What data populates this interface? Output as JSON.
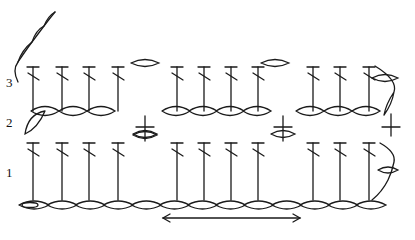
{
  "diagram": {
    "type": "crochet-stitch-chart",
    "row_labels": [
      {
        "text": "3",
        "x": 6,
        "y": 76
      },
      {
        "text": "2",
        "x": 6,
        "y": 116
      },
      {
        "text": "1",
        "x": 6,
        "y": 166
      }
    ],
    "colors": {
      "ink": "#1a1a1a",
      "background": "#ffffff"
    },
    "row3": {
      "top_y": 67,
      "bottom_y": 111,
      "dc_columns_x": [
        33,
        62,
        89,
        118,
        177,
        204,
        231,
        258,
        313,
        340,
        369
      ],
      "chain_ovals": [
        {
          "cx": 145,
          "cy": 63
        },
        {
          "cx": 275,
          "cy": 63
        }
      ]
    },
    "row2": {
      "oval_y": 111,
      "oval_groups": [
        {
          "x_start": 45,
          "count": 3,
          "step": 28
        },
        {
          "x_start": 176,
          "count": 4,
          "step": 27
        },
        {
          "x_start": 310,
          "count": 3,
          "step": 28
        }
      ],
      "sc_markers": [
        {
          "x": 145,
          "y": 132
        },
        {
          "x": 283,
          "y": 132
        },
        {
          "x": 391,
          "y": 130
        }
      ],
      "turning_chain_left": true
    },
    "row1": {
      "top_y": 143,
      "bottom_y": 200,
      "dc_columns_x": [
        33,
        62,
        89,
        118,
        177,
        204,
        231,
        258,
        313,
        340,
        369
      ]
    },
    "foundation_chain": {
      "y": 205,
      "x_start": 20,
      "x_end": 385,
      "link_count": 13
    },
    "start_chain_top": {
      "from": [
        18,
        82
      ],
      "to": [
        55,
        12
      ]
    },
    "repeat_arrow": {
      "x1": 163,
      "x2": 300,
      "y": 218,
      "direction": "both"
    }
  }
}
